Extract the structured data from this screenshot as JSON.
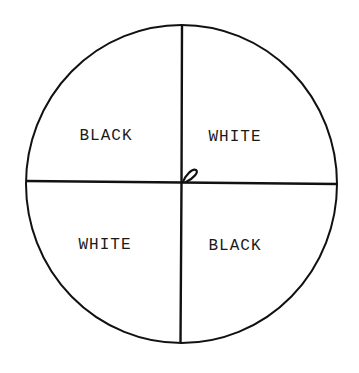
{
  "diagram": {
    "type": "quadrant-disk",
    "colors": {
      "stroke": "#111111",
      "background": "#ffffff",
      "text": "#1a1a1a"
    },
    "quadrants": [
      {
        "position": "top-left",
        "label": "BLACK"
      },
      {
        "position": "top-right",
        "label": "WHITE"
      },
      {
        "position": "bottom-left",
        "label": "WHITE"
      },
      {
        "position": "bottom-right",
        "label": "BLACK"
      }
    ],
    "center_marker": "pivot-loop"
  }
}
